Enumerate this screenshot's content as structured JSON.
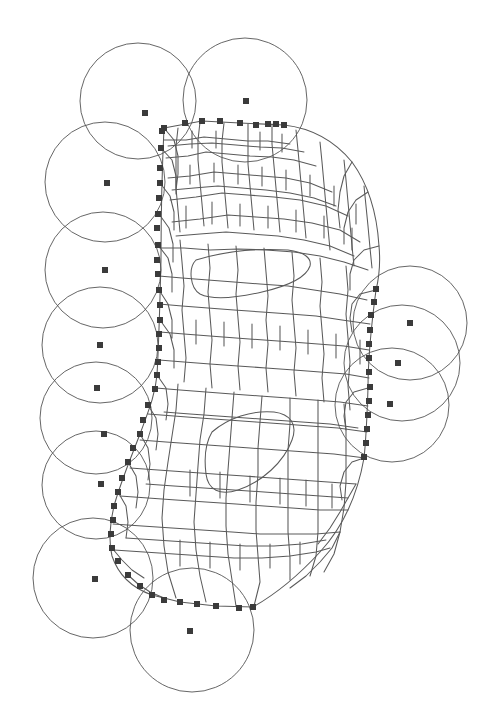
{
  "figure": {
    "kind": "computational-geometry-diagram",
    "background_color": "#ffffff",
    "canvas": {
      "width": 493,
      "height": 723
    },
    "style": {
      "mesh_edge_color": "#5a5a5a",
      "mesh_edge_width": 1.05,
      "circle_stroke_color": "#555555",
      "circle_stroke_width": 0.9,
      "marker_color": "#3b3b3b",
      "marker_size": 6
    },
    "legend_note": "No textual labels, axes, or legend appear in the figure."
  },
  "chart_data": {
    "type": "scatter",
    "title": "",
    "xlabel": "",
    "ylabel": "",
    "xlim": [
      0,
      493
    ],
    "ylim": [
      0,
      723
    ],
    "grid": false,
    "legend_position": "none",
    "series": [
      {
        "name": "covering-discs",
        "kind": "circle",
        "stroke": "#555555",
        "points": [
          {
            "cx": 138,
            "cy": 101,
            "r": 58
          },
          {
            "cx": 245,
            "cy": 100,
            "r": 62
          },
          {
            "cx": 105,
            "cy": 182,
            "r": 60
          },
          {
            "cx": 103,
            "cy": 270,
            "r": 58
          },
          {
            "cx": 100,
            "cy": 345,
            "r": 58
          },
          {
            "cx": 96,
            "cy": 418,
            "r": 56
          },
          {
            "cx": 96,
            "cy": 485,
            "r": 54
          },
          {
            "cx": 93,
            "cy": 578,
            "r": 60
          },
          {
            "cx": 192,
            "cy": 630,
            "r": 62
          },
          {
            "cx": 410,
            "cy": 323,
            "r": 57
          },
          {
            "cx": 402,
            "cy": 363,
            "r": 58
          },
          {
            "cx": 392,
            "cy": 405,
            "r": 57
          }
        ]
      },
      {
        "name": "disc-centres",
        "kind": "square-marker",
        "fill": "#3b3b3b",
        "points": [
          {
            "x": 145,
            "y": 113
          },
          {
            "x": 246,
            "y": 101
          },
          {
            "x": 107,
            "y": 183
          },
          {
            "x": 105,
            "y": 270
          },
          {
            "x": 100,
            "y": 345
          },
          {
            "x": 97,
            "y": 388
          },
          {
            "x": 104,
            "y": 434
          },
          {
            "x": 101,
            "y": 484
          },
          {
            "x": 95,
            "y": 579
          },
          {
            "x": 190,
            "y": 631
          },
          {
            "x": 410,
            "y": 323
          },
          {
            "x": 398,
            "y": 363
          },
          {
            "x": 390,
            "y": 404
          }
        ]
      },
      {
        "name": "boundary-seed-markers",
        "kind": "square-marker",
        "fill": "#3b3b3b",
        "points": [
          {
            "x": 164,
            "y": 128
          },
          {
            "x": 185,
            "y": 123
          },
          {
            "x": 202,
            "y": 121
          },
          {
            "x": 220,
            "y": 121
          },
          {
            "x": 240,
            "y": 123
          },
          {
            "x": 256,
            "y": 125
          },
          {
            "x": 268,
            "y": 124
          },
          {
            "x": 276,
            "y": 124
          },
          {
            "x": 284,
            "y": 125
          },
          {
            "x": 162,
            "y": 131
          },
          {
            "x": 161,
            "y": 148
          },
          {
            "x": 160,
            "y": 168
          },
          {
            "x": 160,
            "y": 183
          },
          {
            "x": 159,
            "y": 198
          },
          {
            "x": 158,
            "y": 214
          },
          {
            "x": 157,
            "y": 228
          },
          {
            "x": 158,
            "y": 245
          },
          {
            "x": 157,
            "y": 260
          },
          {
            "x": 158,
            "y": 274
          },
          {
            "x": 159,
            "y": 290
          },
          {
            "x": 160,
            "y": 305
          },
          {
            "x": 160,
            "y": 320
          },
          {
            "x": 159,
            "y": 334
          },
          {
            "x": 159,
            "y": 348
          },
          {
            "x": 158,
            "y": 362
          },
          {
            "x": 157,
            "y": 375
          },
          {
            "x": 155,
            "y": 389
          },
          {
            "x": 148,
            "y": 405
          },
          {
            "x": 143,
            "y": 420
          },
          {
            "x": 140,
            "y": 434
          },
          {
            "x": 133,
            "y": 448
          },
          {
            "x": 128,
            "y": 462
          },
          {
            "x": 122,
            "y": 478
          },
          {
            "x": 118,
            "y": 492
          },
          {
            "x": 114,
            "y": 506
          },
          {
            "x": 113,
            "y": 520
          },
          {
            "x": 111,
            "y": 534
          },
          {
            "x": 112,
            "y": 548
          },
          {
            "x": 118,
            "y": 561
          },
          {
            "x": 128,
            "y": 575
          },
          {
            "x": 140,
            "y": 586
          },
          {
            "x": 152,
            "y": 595
          },
          {
            "x": 164,
            "y": 600
          },
          {
            "x": 180,
            "y": 602
          },
          {
            "x": 197,
            "y": 604
          },
          {
            "x": 216,
            "y": 606
          },
          {
            "x": 239,
            "y": 608
          },
          {
            "x": 253,
            "y": 607
          },
          {
            "x": 376,
            "y": 289
          },
          {
            "x": 374,
            "y": 302
          },
          {
            "x": 371,
            "y": 315
          },
          {
            "x": 370,
            "y": 330
          },
          {
            "x": 369,
            "y": 344
          },
          {
            "x": 369,
            "y": 358
          },
          {
            "x": 369,
            "y": 372
          },
          {
            "x": 370,
            "y": 387
          },
          {
            "x": 369,
            "y": 401
          },
          {
            "x": 368,
            "y": 415
          },
          {
            "x": 367,
            "y": 429
          },
          {
            "x": 366,
            "y": 443
          },
          {
            "x": 364,
            "y": 457
          }
        ]
      }
    ]
  }
}
